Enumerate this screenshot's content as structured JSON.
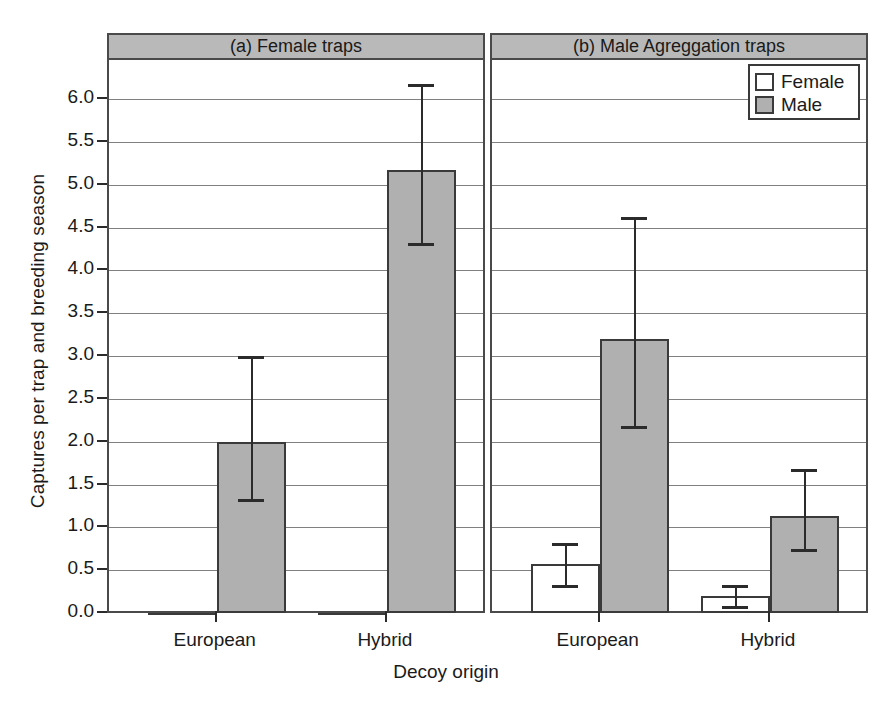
{
  "chart_data": {
    "type": "bar",
    "title": "",
    "xlabel": "Decoy origin",
    "ylabel": "Captures per trap and breeding season",
    "ylim": [
      0.0,
      6.35
    ],
    "yticks": [
      "0.0",
      "0.5",
      "1.0",
      "1.5",
      "2.0",
      "2.5",
      "3.0",
      "3.5",
      "4.0",
      "4.5",
      "5.0",
      "5.5",
      "6.0"
    ],
    "ytick_values": [
      0.0,
      0.5,
      1.0,
      1.5,
      2.0,
      2.5,
      3.0,
      3.5,
      4.0,
      4.5,
      5.0,
      5.5,
      6.0
    ],
    "grid": "horizontal",
    "categories": [
      "European",
      "Hybrid"
    ],
    "legend": {
      "position": "top-right",
      "entries": [
        {
          "name": "Female",
          "color": "#ffffff"
        },
        {
          "name": "Male",
          "color": "#b0b0b0"
        }
      ]
    },
    "panels": [
      {
        "id": "a",
        "title": "(a) Female traps",
        "series": [
          {
            "name": "Female",
            "color": "#ffffff",
            "values": [
              0.0,
              0.0
            ],
            "err_low": [
              0.0,
              0.0
            ],
            "err_high": [
              0.0,
              0.0
            ]
          },
          {
            "name": "Male",
            "color": "#b0b0b0",
            "values": [
              2.0,
              5.17
            ],
            "err_low": [
              1.33,
              4.32
            ],
            "err_high": [
              3.0,
              6.18
            ]
          }
        ]
      },
      {
        "id": "b",
        "title": "(b) Male Agreggation traps",
        "series": [
          {
            "name": "Female",
            "color": "#ffffff",
            "values": [
              0.57,
              0.2
            ],
            "err_low": [
              0.33,
              0.08
            ],
            "err_high": [
              0.82,
              0.33
            ]
          },
          {
            "name": "Male",
            "color": "#b0b0b0",
            "values": [
              3.2,
              1.13
            ],
            "err_low": [
              2.18,
              0.75
            ],
            "err_high": [
              4.62,
              1.68
            ]
          }
        ]
      }
    ]
  },
  "axes": {
    "y_title": "Captures per trap and breeding season",
    "x_title": "Decoy origin",
    "ytick_labels": [
      "6.0",
      "5.5",
      "5.0",
      "4.5",
      "4.0",
      "3.5",
      "3.0",
      "2.5",
      "2.0",
      "1.5",
      "1.0",
      "0.5",
      "0.0"
    ],
    "xtick_labels_panel_a": [
      "European",
      "Hybrid"
    ],
    "xtick_labels_panel_b": [
      "European",
      "Hybrid"
    ]
  },
  "panel_titles": {
    "a": "(a) Female traps",
    "b": "(b) Male Agreggation traps"
  },
  "legend": {
    "female_label": "Female",
    "male_label": "Male"
  },
  "colors": {
    "male_fill": "#b0b0b0",
    "female_fill": "#ffffff",
    "strip_fill": "#b9b9b9",
    "line": "#3a3a3a",
    "grid": "#808080"
  }
}
